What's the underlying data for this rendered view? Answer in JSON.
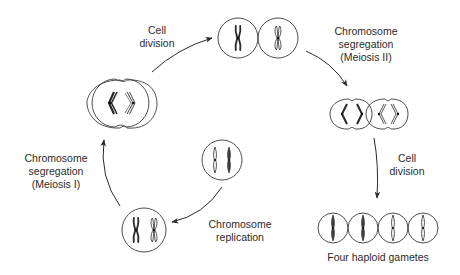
{
  "diagram": {
    "colors": {
      "stroke": "#3a3a3a",
      "text": "#2a2a2a",
      "background": "#ffffff"
    },
    "stages": [
      {
        "id": "replicated",
        "description": "Diploid cell with two replicated chromosomes"
      },
      {
        "id": "meiosis-1-dividing",
        "description": "Cell dividing, homologs separating"
      },
      {
        "id": "two-cells",
        "description": "Two daughter cells, one replicated chromosome each"
      },
      {
        "id": "meiosis-2-dividing",
        "description": "Two cells dividing, sister chromatids separating"
      },
      {
        "id": "gametes",
        "description": "Four haploid gametes"
      },
      {
        "id": "unreplicated",
        "description": "Diploid cell with two unreplicated chromosomes"
      }
    ],
    "labels": {
      "cell_division_1": [
        "Cell",
        "division"
      ],
      "meiosis_2": [
        "Chromosome",
        "segregation",
        "(Meiosis II)"
      ],
      "cell_division_2": [
        "Cell",
        "division"
      ],
      "gametes": "Four haploid gametes",
      "replication": [
        "Chromosome",
        "replication"
      ],
      "meiosis_1": [
        "Chromosome",
        "segregation",
        "(Meiosis I)"
      ]
    },
    "arrows": [
      {
        "from": "meiosis-1-dividing",
        "to": "two-cells",
        "label": "Cell division"
      },
      {
        "from": "two-cells",
        "to": "meiosis-2-dividing",
        "label": "Chromosome segregation (Meiosis II)"
      },
      {
        "from": "meiosis-2-dividing",
        "to": "gametes",
        "label": "Cell division"
      },
      {
        "from": "unreplicated",
        "to": "replicated",
        "label": "Chromosome replication"
      },
      {
        "from": "replicated",
        "to": "meiosis-1-dividing",
        "label": "Chromosome segregation (Meiosis I)"
      }
    ]
  }
}
